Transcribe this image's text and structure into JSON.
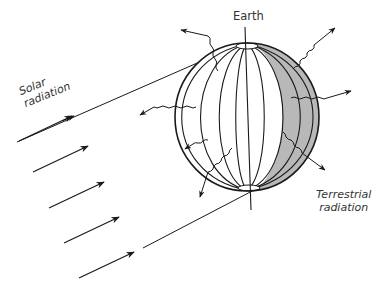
{
  "diagram": {
    "labels": {
      "earth": "Earth",
      "solar_line1": "Solar",
      "solar_line2": "radiation",
      "terrestrial_line1": "Terrestrial",
      "terrestrial_line2": "radiation"
    },
    "colors": {
      "stroke": "#1a1a1a",
      "night_shade": "#b8b8b8",
      "text": "#333333",
      "background": "#ffffff"
    },
    "elements": {
      "globe": {
        "cx": 247,
        "cy": 117,
        "rx": 72,
        "ry": 74,
        "meridians": 8
      },
      "solar_arrows": 5,
      "terrestrial_wavy_arrows": 7
    }
  }
}
